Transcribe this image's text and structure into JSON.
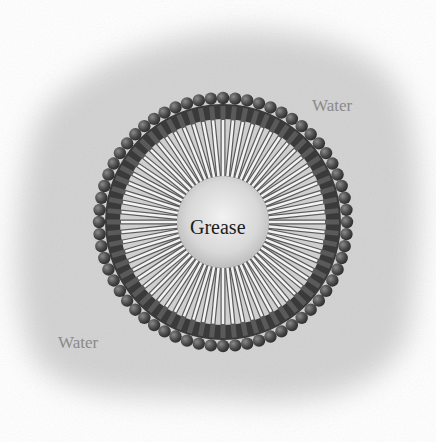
{
  "diagram": {
    "labels": {
      "water_top_right": "Water",
      "water_bottom_left": "Water",
      "core": "Grease"
    },
    "colors": {
      "water": "#d2d2d2",
      "head": "#4a4a4a",
      "tail": "#e8e8e8",
      "core": "#dcdcdc"
    },
    "micelle": {
      "center": [
        223,
        222
      ],
      "head_radius_px": 124,
      "core_radius_px": 46,
      "molecule_count": 64
    }
  }
}
